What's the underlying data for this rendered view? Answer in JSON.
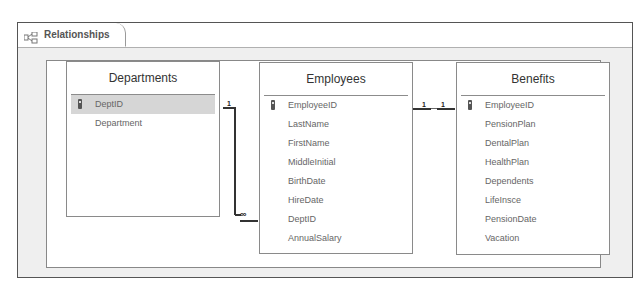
{
  "tab": {
    "label": "Relationships",
    "icon": "relationships-icon"
  },
  "tables": [
    {
      "name": "Departments",
      "fields": [
        {
          "name": "DeptID",
          "primary_key": true,
          "selected": true
        },
        {
          "name": "Department",
          "primary_key": false
        }
      ]
    },
    {
      "name": "Employees",
      "fields": [
        {
          "name": "EmployeeID",
          "primary_key": true
        },
        {
          "name": "LastName"
        },
        {
          "name": "FirstName"
        },
        {
          "name": "MiddleInitial"
        },
        {
          "name": "BirthDate"
        },
        {
          "name": "HireDate"
        },
        {
          "name": "DeptID"
        },
        {
          "name": "AnnualSalary"
        }
      ]
    },
    {
      "name": "Benefits",
      "fields": [
        {
          "name": "EmployeeID",
          "primary_key": true
        },
        {
          "name": "PensionPlan"
        },
        {
          "name": "DentalPlan"
        },
        {
          "name": "HealthPlan"
        },
        {
          "name": "Dependents"
        },
        {
          "name": "LifeInsce"
        },
        {
          "name": "PensionDate"
        },
        {
          "name": "Vacation"
        }
      ]
    }
  ],
  "relationships": [
    {
      "from": "Departments.DeptID",
      "to": "Employees.DeptID",
      "from_cardinality": "1",
      "to_cardinality": "∞"
    },
    {
      "from": "Employees.EmployeeID",
      "to": "Benefits.EmployeeID",
      "from_cardinality": "1",
      "to_cardinality": "1"
    }
  ]
}
